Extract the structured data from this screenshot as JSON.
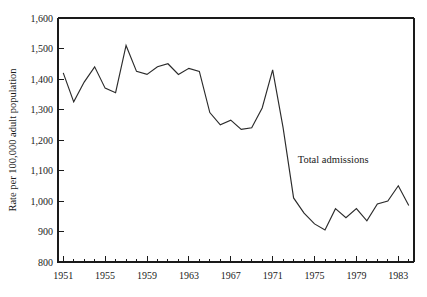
{
  "chart_data": {
    "type": "line",
    "title": "",
    "subtitle": "",
    "xlabel": "",
    "ylabel": "Rate per 100,000 adult population",
    "xlim": [
      1950.5,
      1984.5
    ],
    "ylim": [
      800,
      1600
    ],
    "y_ticks": [
      800,
      900,
      1000,
      1100,
      1200,
      1300,
      1400,
      1500,
      1600
    ],
    "y_tick_labels": [
      "800",
      "900",
      "1,000",
      "1,100",
      "1,200",
      "1,300",
      "1,400",
      "1,500",
      "1,600"
    ],
    "x_ticks": [
      1951,
      1952,
      1953,
      1954,
      1955,
      1956,
      1957,
      1958,
      1959,
      1960,
      1961,
      1962,
      1963,
      1964,
      1965,
      1966,
      1967,
      1968,
      1969,
      1970,
      1971,
      1972,
      1973,
      1974,
      1975,
      1976,
      1977,
      1978,
      1979,
      1980,
      1981,
      1982,
      1983,
      1984
    ],
    "x_tick_labels": [
      "1951",
      "1955",
      "1959",
      "1963",
      "1967",
      "1971",
      "1975",
      "1979",
      "1983"
    ],
    "x_labeled_ticks": [
      1951,
      1955,
      1959,
      1963,
      1967,
      1971,
      1975,
      1979,
      1983
    ],
    "grid": false,
    "legend_position": "inline-annotation",
    "series": [
      {
        "name": "Total admissions",
        "annotation": "Total admissions",
        "annotation_x": 1973.4,
        "annotation_y": 1125,
        "color": "#2b2b2b",
        "x": [
          1951,
          1952,
          1953,
          1954,
          1955,
          1956,
          1957,
          1958,
          1959,
          1960,
          1961,
          1962,
          1963,
          1964,
          1965,
          1966,
          1967,
          1968,
          1969,
          1970,
          1971,
          1972,
          1973,
          1974,
          1975,
          1976,
          1977,
          1978,
          1979,
          1980,
          1981,
          1982,
          1983,
          1984
        ],
        "values": [
          1420,
          1325,
          1390,
          1440,
          1370,
          1355,
          1510,
          1425,
          1415,
          1440,
          1450,
          1415,
          1435,
          1425,
          1290,
          1250,
          1265,
          1235,
          1240,
          1305,
          1430,
          1240,
          1010,
          960,
          925,
          905,
          975,
          945,
          975,
          935,
          990,
          1000,
          1050,
          985
        ]
      }
    ]
  }
}
